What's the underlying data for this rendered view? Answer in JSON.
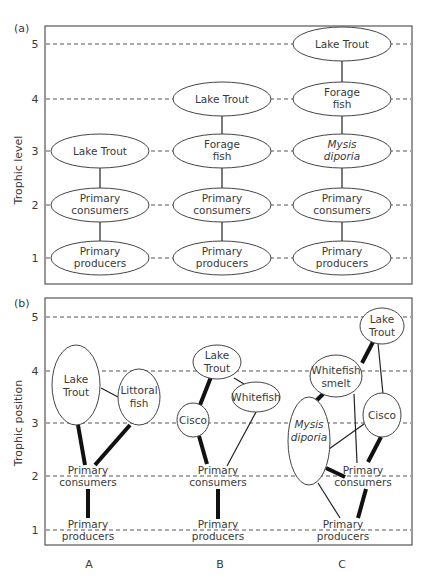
{
  "panel_a": {
    "label": "(a)",
    "y_axis_label": "Trophic level",
    "ticks": [
      "1",
      "2",
      "3",
      "4",
      "5"
    ],
    "columns": {
      "A": [
        {
          "level": 1,
          "line1": "Primary",
          "line2": "producers"
        },
        {
          "level": 2,
          "line1": "Primary",
          "line2": "consumers"
        },
        {
          "level": 3,
          "line1": "Lake Trout",
          "line2": ""
        }
      ],
      "B": [
        {
          "level": 1,
          "line1": "Primary",
          "line2": "producers"
        },
        {
          "level": 2,
          "line1": "Primary",
          "line2": "consumers"
        },
        {
          "level": 3,
          "line1": "Forage",
          "line2": "fish"
        },
        {
          "level": 4,
          "line1": "Lake Trout",
          "line2": ""
        }
      ],
      "C": [
        {
          "level": 1,
          "line1": "Primary",
          "line2": "producers"
        },
        {
          "level": 2,
          "line1": "Primary",
          "line2": "consumers"
        },
        {
          "level": 3,
          "line1": "Mysis",
          "line2": "diporia",
          "italic": true
        },
        {
          "level": 4,
          "line1": "Forage",
          "line2": "fish"
        },
        {
          "level": 5,
          "line1": "Lake Trout",
          "line2": ""
        }
      ]
    }
  },
  "panel_b": {
    "label": "(b)",
    "y_axis_label": "Trophic position",
    "ticks": [
      "1",
      "2",
      "3",
      "4",
      "5"
    ],
    "columns": {
      "A": {
        "lake_trout": {
          "line1": "Lake",
          "line2": "Trout"
        },
        "littoral_fish": {
          "line1": "Littoral",
          "line2": "fish"
        },
        "primary_consumers": {
          "line1": "Primary",
          "line2": "consumers"
        },
        "primary_producers": {
          "line1": "Primary",
          "line2": "producers"
        }
      },
      "B": {
        "lake_trout": {
          "line1": "Lake",
          "line2": "Trout"
        },
        "cisco": {
          "line1": "Cisco"
        },
        "whitefish": {
          "line1": "Whitefish"
        },
        "primary_consumers": {
          "line1": "Primary",
          "line2": "consumers"
        },
        "primary_producers": {
          "line1": "Primary",
          "line2": "producers"
        }
      },
      "C": {
        "lake_trout": {
          "line1": "Lake",
          "line2": "Trout"
        },
        "whitefish_smelt": {
          "line1": "Whitefish",
          "line2": "smelt"
        },
        "mysis": {
          "line1": "Mysis",
          "line2": "diporia"
        },
        "cisco": {
          "line1": "Cisco"
        },
        "primary_consumers": {
          "line1": "Primary",
          "line2": "consumers"
        },
        "primary_producers": {
          "line1": "Primary",
          "line2": "producers"
        }
      }
    }
  },
  "x_labels": [
    "A",
    "B",
    "C"
  ]
}
